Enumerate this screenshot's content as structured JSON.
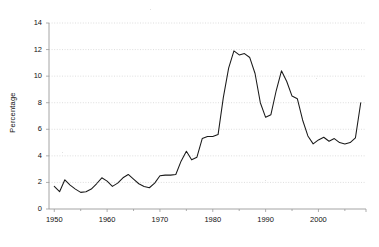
{
  "chart_data": {
    "type": "line",
    "title": "",
    "subtitle": "",
    "xlabel": "",
    "ylabel": "Percentage",
    "xlim": [
      1949,
      2009
    ],
    "ylim": [
      0,
      14
    ],
    "grid": true,
    "legend": false,
    "legend_position": "none",
    "y_ticks": [
      0,
      2,
      4,
      6,
      8,
      10,
      12,
      14
    ],
    "y_tick_labels": [
      "0",
      "2",
      "4",
      "6",
      "8",
      "10",
      "12",
      "14"
    ],
    "x_ticks": [
      1950,
      1960,
      1970,
      1980,
      1990,
      2000
    ],
    "x_tick_labels": [
      "1950",
      "1960",
      "1970",
      "1980",
      "1990",
      "2000"
    ],
    "x_minor_ticks": [
      1955,
      1965,
      1975,
      1985,
      1995,
      2005
    ],
    "series": [
      {
        "name": "Percentage",
        "color": "#1a1a1a",
        "x": [
          1950,
          1951,
          1952,
          1953,
          1954,
          1955,
          1956,
          1957,
          1958,
          1959,
          1960,
          1961,
          1962,
          1963,
          1964,
          1965,
          1966,
          1967,
          1968,
          1969,
          1970,
          1971,
          1972,
          1973,
          1974,
          1975,
          1976,
          1977,
          1978,
          1979,
          1980,
          1981,
          1982,
          1983,
          1984,
          1985,
          1986,
          1987,
          1988,
          1989,
          1990,
          1991,
          1992,
          1993,
          1994,
          1995,
          1996,
          1997,
          1998,
          1999,
          2000,
          2001,
          2002,
          2003,
          2004,
          2005,
          2006,
          2007,
          2008
        ],
        "values": [
          1.7,
          1.3,
          2.2,
          1.8,
          1.5,
          1.25,
          1.3,
          1.5,
          1.9,
          2.35,
          2.1,
          1.7,
          1.95,
          2.35,
          2.6,
          2.25,
          1.9,
          1.7,
          1.6,
          1.95,
          2.5,
          2.55,
          2.55,
          2.6,
          3.6,
          4.35,
          3.7,
          3.9,
          5.3,
          5.45,
          5.45,
          5.6,
          8.4,
          10.6,
          11.9,
          11.6,
          11.7,
          11.4,
          10.2,
          8.0,
          6.9,
          7.1,
          8.9,
          10.4,
          9.6,
          8.5,
          8.3,
          6.7,
          5.5,
          4.9,
          5.2,
          5.4,
          5.1,
          5.3,
          5.0,
          4.9,
          5.0,
          5.35,
          8.0
        ]
      }
    ]
  }
}
